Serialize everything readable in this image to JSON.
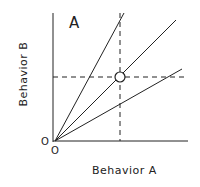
{
  "diagram": {
    "panel_label": "A",
    "x_axis_label": "Behavior A",
    "y_axis_label": "Behavior B",
    "origin_labels": [
      "O",
      "O"
    ],
    "lines": [
      {
        "name": "steep-line",
        "from": [
          55,
          141
        ],
        "to": [
          124,
          13
        ]
      },
      {
        "name": "middle-line",
        "from": [
          55,
          141
        ],
        "to": [
          176,
          20
        ]
      },
      {
        "name": "shallow-line",
        "from": [
          55,
          141
        ],
        "to": [
          182,
          69
        ]
      }
    ],
    "reference_point": {
      "x": 120,
      "y": 77,
      "marker": "open-circle"
    },
    "dashed_guides": [
      "vertical at Behavior A = point",
      "horizontal at Behavior B = point"
    ]
  }
}
